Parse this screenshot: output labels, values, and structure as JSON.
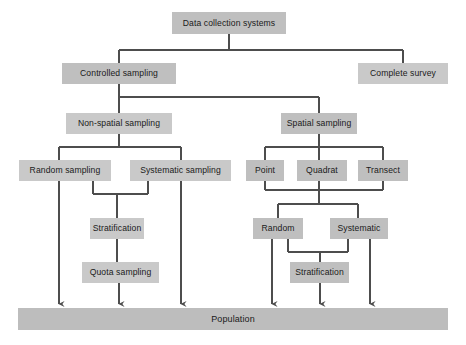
{
  "diagram": {
    "type": "flowchart",
    "colors": {
      "node_fill": "#bfbfbf",
      "node_fill_light": "#c9c9c9",
      "connector": "#4d4d4d",
      "background": "#ffffff",
      "text": "#1a1a1a"
    },
    "nodes": {
      "root": "Data collection systems",
      "controlled_sampling": "Controlled sampling",
      "complete_survey": "Complete survey",
      "non_spatial_sampling": "Non-spatial sampling",
      "spatial_sampling": "Spatial sampling",
      "random_sampling": "Random sampling",
      "systematic_sampling": "Systematic sampling",
      "point": "Point",
      "quadrat": "Quadrat",
      "transect": "Transect",
      "stratification_left": "Stratification",
      "random": "Random",
      "systematic": "Systematic",
      "quota_sampling": "Quota sampling",
      "stratification_right": "Stratification",
      "population": "Population"
    },
    "edges": [
      {
        "from": "root",
        "to": "controlled_sampling"
      },
      {
        "from": "root",
        "to": "complete_survey"
      },
      {
        "from": "controlled_sampling",
        "to": "non_spatial_sampling"
      },
      {
        "from": "controlled_sampling",
        "to": "spatial_sampling"
      },
      {
        "from": "non_spatial_sampling",
        "to": "random_sampling"
      },
      {
        "from": "non_spatial_sampling",
        "to": "systematic_sampling"
      },
      {
        "from": "spatial_sampling",
        "to": "point"
      },
      {
        "from": "spatial_sampling",
        "to": "quadrat"
      },
      {
        "from": "spatial_sampling",
        "to": "transect"
      },
      {
        "from": "random_sampling",
        "to": "stratification_left"
      },
      {
        "from": "systematic_sampling",
        "to": "stratification_left"
      },
      {
        "from": "stratification_left",
        "to": "quota_sampling"
      },
      {
        "from": "point",
        "to": "random"
      },
      {
        "from": "quadrat",
        "to": "random"
      },
      {
        "from": "transect",
        "to": "random"
      },
      {
        "from": "point",
        "to": "systematic"
      },
      {
        "from": "quadrat",
        "to": "systematic"
      },
      {
        "from": "transect",
        "to": "systematic"
      },
      {
        "from": "random",
        "to": "stratification_right"
      },
      {
        "from": "systematic",
        "to": "stratification_right"
      },
      {
        "from": "random_sampling",
        "to": "population"
      },
      {
        "from": "quota_sampling",
        "to": "population"
      },
      {
        "from": "systematic_sampling",
        "to": "population"
      },
      {
        "from": "random",
        "to": "population"
      },
      {
        "from": "stratification_right",
        "to": "population"
      },
      {
        "from": "systematic",
        "to": "population"
      }
    ],
    "arrow_targets_x": [
      59,
      119,
      181,
      272,
      320,
      370
    ]
  }
}
